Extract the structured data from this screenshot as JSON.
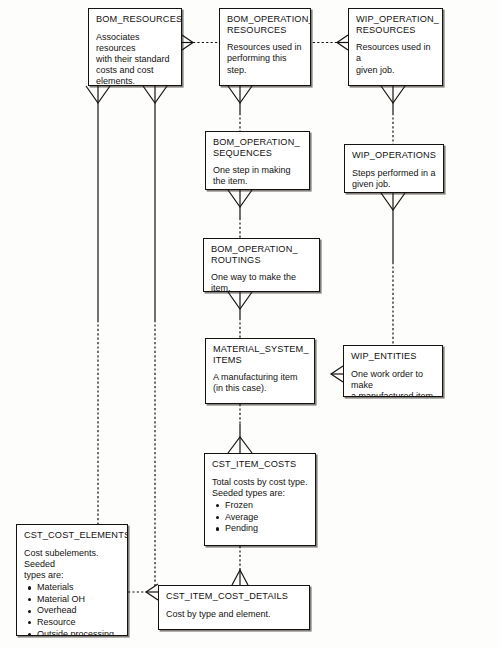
{
  "diagram": {
    "type": "entity-relationship-diagram",
    "notation": "crow's foot",
    "background_color": "#fdfdfb",
    "box_fill": "#ffffff",
    "line_color": "#16120f"
  },
  "entities": [
    {
      "id": "bom_resources",
      "name": "BOM_RESOURCES",
      "description": "Associates resources\nwith their standard\ncosts and cost\nelements.",
      "items": []
    },
    {
      "id": "bom_operation_resources",
      "name": "BOM_OPERATION_\nRESOURCES",
      "description": "Resources used in\nperforming this step.",
      "items": []
    },
    {
      "id": "wip_operation_resources",
      "name": "WIP_OPERATION_\nRESOURCES",
      "description": "Resources used in a\ngiven job.",
      "items": []
    },
    {
      "id": "bom_operation_sequences",
      "name": "BOM_OPERATION_\nSEQUENCES",
      "description": "One step in making\nthe item.",
      "items": []
    },
    {
      "id": "wip_operations",
      "name": "WIP_OPERATIONS",
      "description": "Steps performed in a\ngiven job.",
      "items": []
    },
    {
      "id": "bom_operation_routings",
      "name": "BOM_OPERATION_\nROUTINGS",
      "description": "One way to make the item.",
      "items": []
    },
    {
      "id": "material_system_items",
      "name": "MATERIAL_SYSTEM_\nITEMS",
      "description": "A manufacturing item\n(in this case).",
      "items": []
    },
    {
      "id": "wip_entities",
      "name": "WIP_ENTITIES",
      "description": "One work order to make\na manufactured item.",
      "items": []
    },
    {
      "id": "cst_item_costs",
      "name": "CST_ITEM_COSTS",
      "description": "Total costs by cost type.\nSeeded types are:",
      "items": [
        "Frozen",
        "Average",
        "Pending"
      ]
    },
    {
      "id": "cst_cost_elements",
      "name": "CST_COST_ELEMENTS",
      "description": "Cost subelements. Seeded\ntypes are:",
      "items": [
        "Materials",
        "Material OH",
        "Overhead",
        "Resource",
        "Outside processing"
      ]
    },
    {
      "id": "cst_item_cost_details",
      "name": "CST_ITEM_COST_DETAILS",
      "description": "Cost by type and element.",
      "items": []
    }
  ],
  "relationships": [
    {
      "from": "bom_resources",
      "to": "bom_operation_resources",
      "style": "dotted",
      "crowfoot_at": "from"
    },
    {
      "from": "wip_operation_resources",
      "to": "bom_operation_resources",
      "style": "dotted",
      "crowfoot_at": "from"
    },
    {
      "from": "bom_operation_resources",
      "to": "bom_operation_sequences",
      "style": "mixed",
      "crowfoot_at": "from"
    },
    {
      "from": "wip_operation_resources",
      "to": "wip_operations",
      "style": "mixed",
      "crowfoot_at": "from"
    },
    {
      "from": "bom_operation_sequences",
      "to": "bom_operation_routings",
      "style": "mixed",
      "crowfoot_at": "from"
    },
    {
      "from": "bom_operation_routings",
      "to": "material_system_items",
      "style": "mixed",
      "crowfoot_at": "from"
    },
    {
      "from": "wip_operations",
      "to": "wip_entities",
      "style": "mixed",
      "crowfoot_at": "from"
    },
    {
      "from": "wip_entities",
      "to": "material_system_items",
      "style": "solid",
      "crowfoot_at": "to"
    },
    {
      "from": "material_system_items",
      "to": "cst_item_costs",
      "style": "mixed",
      "crowfoot_at": "to"
    },
    {
      "from": "cst_item_costs",
      "to": "cst_item_cost_details",
      "style": "dotted",
      "crowfoot_at": "to"
    },
    {
      "from": "bom_resources",
      "to": "cst_cost_elements",
      "style": "mixed",
      "crowfoot_at": "from"
    },
    {
      "from": "bom_resources",
      "to": "cst_item_cost_details",
      "style": "mixed",
      "crowfoot_at": "from"
    },
    {
      "from": "cst_cost_elements",
      "to": "cst_item_cost_details",
      "style": "solid",
      "crowfoot_at": "to"
    }
  ]
}
